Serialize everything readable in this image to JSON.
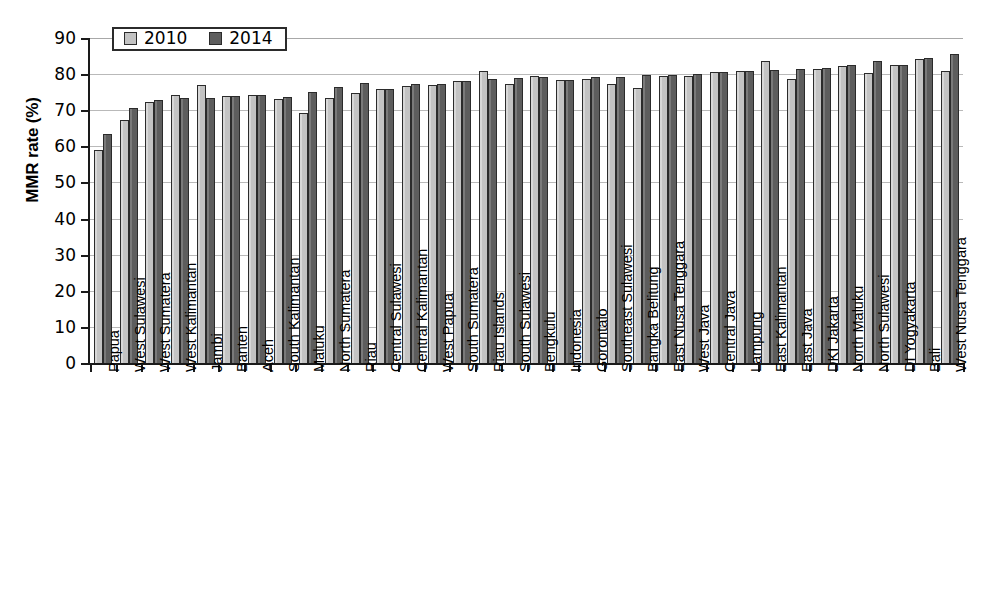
{
  "chart_data": {
    "type": "bar",
    "title": "",
    "xlabel": "",
    "ylabel": "MMR rate (%)",
    "ylim": [
      0,
      90
    ],
    "ytick_step": 10,
    "yticks": [
      0,
      10,
      20,
      30,
      40,
      50,
      60,
      70,
      80,
      90
    ],
    "grid": true,
    "legend_position": "top-left",
    "colors": {
      "2010": "#c3c3c3",
      "2014": "#5d5d5d",
      "axis": "#1a1a1a",
      "grid": "#b9b9b9"
    },
    "categories": [
      "Papua",
      "West Sulawesi",
      "West Sumatera",
      "West Kalimantan",
      "Jambi",
      "Banten",
      "Aceh",
      "South Kalimantan",
      "Maluku",
      "North Sumatera",
      "Riau",
      "Central Sulawesi",
      "Central Kalimantan",
      "West Papua",
      "South Sumatera",
      "Riau Islands",
      "South Sulawesi",
      "Bengkulu",
      "Indonesia",
      "Gorontalo",
      "Southeast Sulawesi",
      "Bangka Belitung",
      "East Nusa Tenggara",
      "West Java",
      "Central Java",
      "Lampung",
      "East Kalimantan",
      "East Java",
      "DKI Jakarta",
      "North Maluku",
      "North Sulawesi",
      "DI Yogyakarta",
      "Bali",
      "West Nusa Tenggara"
    ],
    "series": [
      {
        "name": "2010",
        "color": "#c3c3c3",
        "values": [
          59.0,
          67.3,
          72.3,
          74.3,
          76.9,
          74.0,
          74.3,
          73.2,
          69.2,
          73.3,
          74.9,
          75.9,
          76.6,
          77.1,
          78.0,
          81.0,
          77.4,
          79.6,
          78.3,
          78.6,
          77.2,
          76.2,
          79.5,
          79.6,
          80.6,
          80.8,
          83.6,
          78.7,
          81.3,
          82.3,
          80.2,
          82.4,
          84.3,
          81.0
        ]
      },
      {
        "name": "2014",
        "color": "#5d5d5d",
        "values": [
          63.3,
          70.7,
          72.8,
          73.4,
          73.3,
          74.0,
          74.2,
          73.8,
          75.1,
          76.3,
          77.5,
          75.9,
          77.3,
          77.2,
          78.2,
          78.7,
          79.0,
          79.1,
          78.4,
          79.2,
          79.1,
          79.8,
          79.8,
          80.0,
          80.7,
          80.9,
          81.2,
          81.5,
          81.6,
          82.4,
          83.5,
          82.6,
          84.5,
          85.5
        ]
      }
    ],
    "legend": [
      "2010",
      "2014"
    ]
  }
}
